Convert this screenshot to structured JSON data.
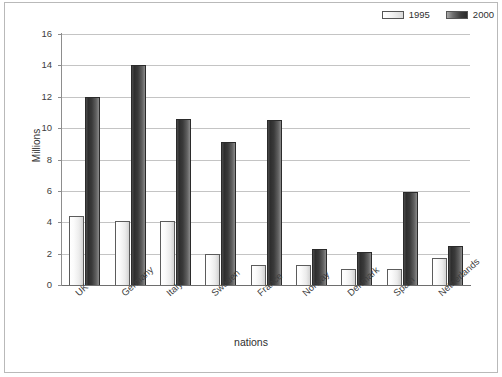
{
  "chart_data": {
    "type": "bar",
    "title": "",
    "xlabel": "nations",
    "ylabel": "Millions",
    "ylim": [
      0,
      16
    ],
    "ytick_step": 2,
    "yticks": [
      "16",
      "14",
      "12",
      "10",
      "8",
      "6",
      "4",
      "2",
      "0"
    ],
    "grid": true,
    "legend_position": "top-right",
    "categories": [
      "UK",
      "Germany",
      "Italy",
      "Sweden",
      "France",
      "Norway",
      "Denmark",
      "Spain",
      "Netherlands"
    ],
    "series": [
      {
        "name": "1995",
        "color": "#ececec",
        "values": [
          4.4,
          4.1,
          4.1,
          2.0,
          1.3,
          1.3,
          1.0,
          1.0,
          1.7
        ]
      },
      {
        "name": "2000",
        "color": "#3a3a3a",
        "values": [
          12.0,
          14.0,
          10.6,
          9.1,
          10.5,
          2.3,
          2.1,
          5.9,
          2.5
        ]
      }
    ]
  },
  "legend": {
    "entries": [
      {
        "label": "1995",
        "swatch": "light-gradient-swatch"
      },
      {
        "label": "2000",
        "swatch": "dark-gradient-swatch"
      }
    ]
  },
  "axes": {
    "y_title": "Millions",
    "x_title": "nations"
  }
}
